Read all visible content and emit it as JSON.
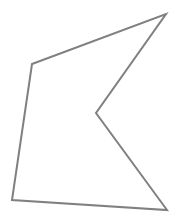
{
  "figure": {
    "name": "concave-polygon",
    "background_color": "#ffffff",
    "stroke_color": "#808080",
    "stroke_width": 2,
    "fill": "none",
    "canvas": {
      "width": 182,
      "height": 216
    },
    "vertex_count": 5,
    "vertices": [
      {
        "label": "upper-left",
        "x": 32,
        "y": 64
      },
      {
        "label": "top-apex",
        "x": 166,
        "y": 14
      },
      {
        "label": "notch-inner",
        "x": 96,
        "y": 113
      },
      {
        "label": "bottom-right",
        "x": 167,
        "y": 210
      },
      {
        "label": "bottom-left",
        "x": 12,
        "y": 200
      }
    ],
    "path": "M 32 64 L 166 14 L 96 113 L 167 210 L 12 200 Z",
    "edges": [
      {
        "label": "top-edge",
        "from": "upper-left",
        "to": "top-apex"
      },
      {
        "label": "upper-notch-edge",
        "from": "top-apex",
        "to": "notch-inner"
      },
      {
        "label": "lower-notch-edge",
        "from": "notch-inner",
        "to": "bottom-right"
      },
      {
        "label": "bottom-edge",
        "from": "bottom-right",
        "to": "bottom-left"
      },
      {
        "label": "left-edge",
        "from": "bottom-left",
        "to": "upper-left"
      }
    ]
  }
}
